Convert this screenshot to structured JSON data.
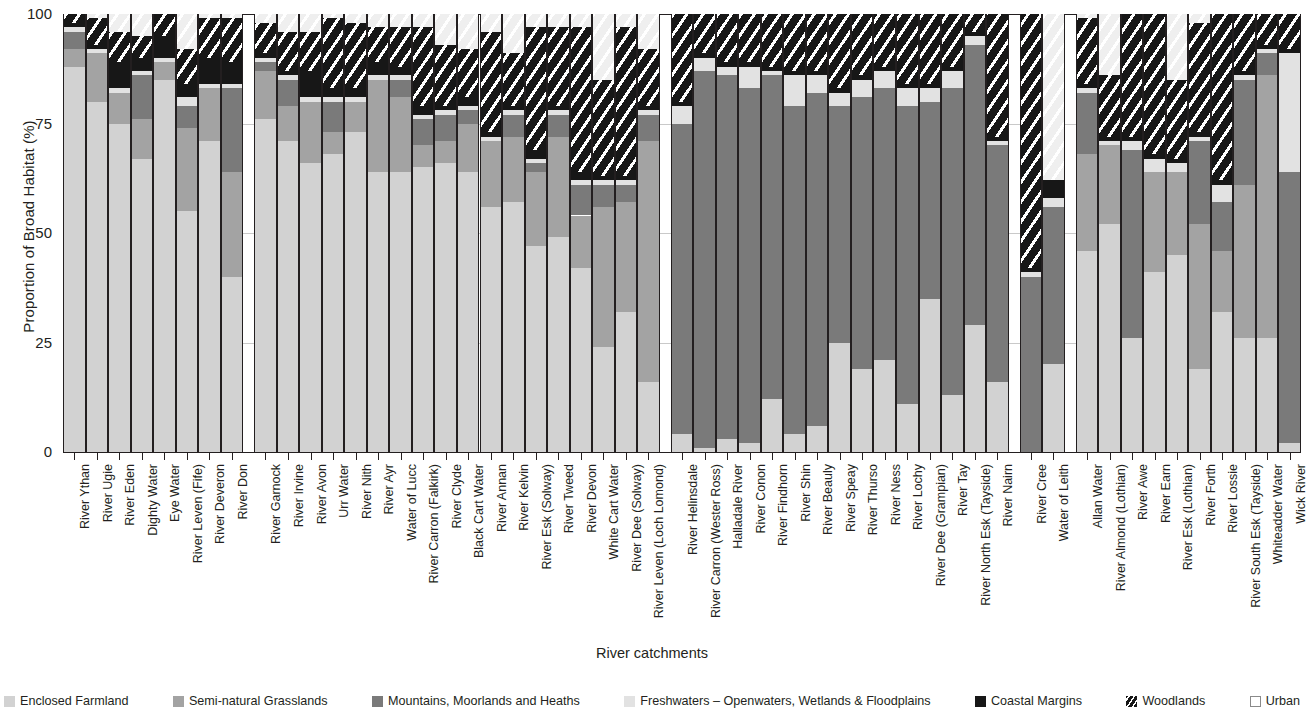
{
  "chart_data": {
    "type": "bar",
    "subtype": "stacked-percentage",
    "title": "",
    "xlabel": "River catchments",
    "ylabel": "Proportion of Broad Habitat (%)",
    "ylim": [
      0,
      100
    ],
    "yticks": [
      0,
      25,
      50,
      75,
      100
    ],
    "grid": true,
    "legend_position": "bottom",
    "series": [
      {
        "name": "Enclosed Farmland",
        "color": "#d2d2d2"
      },
      {
        "name": "Semi-natural Grasslands",
        "color": "#a3a3a3"
      },
      {
        "name": "Mountains, Moorlands and Heaths",
        "color": "#7a7a7a"
      },
      {
        "name": "Freshwaters – Openwaters, Wetlands  & Floodplains",
        "color": "#e2e2e2"
      },
      {
        "name": "Coastal Margins",
        "color": "#171717"
      },
      {
        "name": "Woodlands",
        "color": "#171717"
      },
      {
        "name": "Urban",
        "color": "#ffffff"
      }
    ],
    "groups": [
      {
        "name": "group-1",
        "categories": [
          "River Ythan",
          "River Ugie",
          "River Eden",
          "Dighty Water",
          "Eye Water",
          "River Leven (Fife)",
          "River Deveron",
          "River Don"
        ],
        "values": [
          [
            88,
            4,
            4,
            1,
            1,
            2,
            0
          ],
          [
            80,
            11,
            0,
            1,
            1,
            6,
            1
          ],
          [
            75,
            7,
            0,
            1,
            6,
            7,
            4
          ],
          [
            67,
            9,
            10,
            1,
            3,
            5,
            5
          ],
          [
            85,
            4,
            0,
            1,
            5,
            5,
            0
          ],
          [
            55,
            19,
            5,
            2,
            3,
            8,
            8
          ],
          [
            71,
            12,
            0,
            1,
            6,
            9,
            1
          ],
          [
            40,
            24,
            19,
            1,
            5,
            10,
            1
          ]
        ]
      },
      {
        "name": "group-2",
        "categories": [
          "River Garnock",
          "River Irvine",
          "River Avon",
          "Urr Water",
          "River Nith",
          "River Ayr",
          "Water of Lucc",
          "River Carron (Falkirk)",
          "River Clyde",
          "Black Cart Water",
          "River Annan",
          "River Kelvin",
          "River Esk (Solway)",
          "River Tweed",
          "River Devon",
          "White Cart Water",
          "River Dee (Solway)",
          "River Leven (Loch Lomond)"
        ],
        "values": [
          [
            76,
            11,
            2,
            1,
            1,
            7,
            2
          ],
          [
            71,
            8,
            6,
            1,
            1,
            9,
            4
          ],
          [
            66,
            14,
            0,
            1,
            6,
            9,
            4
          ],
          [
            68,
            5,
            7,
            1,
            2,
            16,
            1
          ],
          [
            73,
            7,
            0,
            1,
            2,
            15,
            2
          ],
          [
            64,
            21,
            0,
            1,
            3,
            8,
            3
          ],
          [
            64,
            17,
            4,
            1,
            2,
            9,
            3
          ],
          [
            65,
            5,
            6,
            1,
            2,
            18,
            3
          ],
          [
            66,
            5,
            6,
            1,
            1,
            14,
            7
          ],
          [
            64,
            11,
            3,
            1,
            2,
            11,
            8
          ],
          [
            56,
            15,
            0,
            1,
            1,
            23,
            4
          ],
          [
            57,
            15,
            5,
            1,
            1,
            12,
            9
          ],
          [
            47,
            17,
            2,
            1,
            2,
            28,
            3
          ],
          [
            49,
            23,
            5,
            1,
            1,
            18,
            3
          ],
          [
            42,
            12,
            7,
            1,
            2,
            33,
            3
          ],
          [
            24,
            32,
            5,
            1,
            1,
            22,
            15
          ],
          [
            32,
            25,
            4,
            1,
            1,
            34,
            3
          ],
          [
            16,
            55,
            6,
            1,
            1,
            13,
            8
          ]
        ]
      },
      {
        "name": "group-3",
        "categories": [
          "River Helinsdale",
          "River Carron (Wester Ross)",
          "Halladale River",
          "River Conon",
          "River Findhorn",
          "River Shin",
          "River Beauly",
          "River Speay",
          "River Thurso",
          "River Ness",
          "River Lochy",
          "River Dee (Grampian)",
          "River Tay",
          "River North Esk (Tayside)",
          "River Nairn"
        ],
        "values": [
          [
            4,
            0,
            71,
            4,
            1,
            20,
            0
          ],
          [
            1,
            0,
            86,
            3,
            1,
            9,
            0
          ],
          [
            3,
            0,
            83,
            2,
            1,
            11,
            0
          ],
          [
            2,
            0,
            81,
            5,
            1,
            11,
            0
          ],
          [
            12,
            0,
            74,
            1,
            1,
            12,
            0
          ],
          [
            4,
            0,
            75,
            7,
            1,
            13,
            0
          ],
          [
            6,
            0,
            76,
            4,
            1,
            13,
            0
          ],
          [
            25,
            0,
            54,
            3,
            1,
            17,
            0
          ],
          [
            19,
            0,
            62,
            4,
            1,
            14,
            0
          ],
          [
            21,
            0,
            62,
            4,
            1,
            12,
            0
          ],
          [
            11,
            0,
            68,
            4,
            1,
            16,
            0
          ],
          [
            35,
            0,
            45,
            3,
            1,
            16,
            0
          ],
          [
            13,
            0,
            70,
            4,
            1,
            12,
            0
          ],
          [
            29,
            0,
            64,
            2,
            1,
            4,
            0
          ],
          [
            16,
            0,
            54,
            1,
            1,
            28,
            0
          ]
        ]
      },
      {
        "name": "group-4",
        "categories": [
          "River Cree",
          "Water of Leith"
        ],
        "values": [
          [
            0,
            0,
            40,
            1,
            1,
            58,
            0
          ],
          [
            20,
            0,
            36,
            2,
            4,
            0,
            38
          ]
        ]
      },
      {
        "name": "group-5",
        "categories": [
          "Allan Water",
          "River Almond (Lothian)",
          "River Awe",
          "River Earn",
          "River Esk (Lothian)",
          "River Forth",
          "River Lossie",
          "River South Esk (Tayside)",
          "Whiteadder Water",
          "Wick River"
        ],
        "values": [
          [
            46,
            22,
            14,
            1,
            1,
            15,
            1
          ],
          [
            52,
            18,
            0,
            1,
            1,
            14,
            14
          ],
          [
            26,
            0,
            43,
            2,
            1,
            28,
            0
          ],
          [
            41,
            23,
            0,
            3,
            1,
            32,
            0
          ],
          [
            45,
            19,
            0,
            2,
            1,
            18,
            15
          ],
          [
            19,
            33,
            19,
            1,
            1,
            25,
            2
          ],
          [
            32,
            14,
            11,
            4,
            1,
            38,
            0
          ],
          [
            26,
            35,
            24,
            1,
            1,
            13,
            0
          ],
          [
            26,
            60,
            5,
            1,
            1,
            7,
            0
          ],
          [
            2,
            0,
            62,
            27,
            1,
            8,
            0
          ]
        ]
      }
    ]
  },
  "axis": {
    "y_title": "Proportion of Broad Habitat (%)",
    "x_title": "River catchments",
    "y_ticks": [
      "100",
      "75",
      "50",
      "25",
      "0"
    ]
  },
  "legend": {
    "items": [
      {
        "label": "Enclosed Farmland",
        "swatch": "enclosed-farmland-swatch"
      },
      {
        "label": "Semi-natural Grasslands",
        "swatch": "semi-natural-grasslands-swatch"
      },
      {
        "label": "Mountains, Moorlands and Heaths",
        "swatch": "mountains-moorlands-heaths-swatch"
      },
      {
        "label": "Freshwaters – Openwaters, Wetlands  & Floodplains",
        "swatch": "freshwaters-swatch"
      },
      {
        "label": "Coastal Margins",
        "swatch": "coastal-margins-swatch"
      },
      {
        "label": "Woodlands",
        "swatch": "woodlands-swatch"
      },
      {
        "label": "Urban",
        "swatch": "urban-swatch"
      }
    ]
  }
}
